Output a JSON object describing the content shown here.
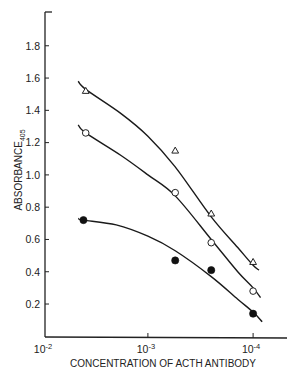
{
  "chart_data": {
    "type": "scatter",
    "title": "",
    "xlabel": "CONCENTRATION OF ACTH ANTIBODY",
    "ylabel": "ABSORBANCE",
    "ylabel_subscript": "405",
    "x_scale": "log",
    "x_reversed": true,
    "xlim": [
      0.01,
      6e-05
    ],
    "ylim": [
      0,
      1.95
    ],
    "x_ticks": [
      {
        "value": 0.01,
        "label": "10",
        "exp": "-2"
      },
      {
        "value": 0.001,
        "label": "10",
        "exp": "-3"
      },
      {
        "value": 0.0001,
        "label": "10",
        "exp": "-4"
      }
    ],
    "y_ticks": [
      0.2,
      0.4,
      0.6,
      0.8,
      1.0,
      1.2,
      1.4,
      1.6,
      1.8
    ],
    "y_tick_labels": [
      "0.2",
      "0.4",
      "0.6",
      "0.8",
      "1.0",
      "1.2",
      "1.4",
      "1.6",
      "1.8"
    ],
    "grid": false,
    "legend": null,
    "series": [
      {
        "name": "open triangles",
        "marker": "triangle-open",
        "x": [
          0.0039,
          0.00055,
          0.00025,
          0.0001
        ],
        "y": [
          1.52,
          1.15,
          0.76,
          0.46
        ],
        "fit_curve": [
          [
            0.0046,
            1.58
          ],
          [
            0.0039,
            1.53
          ],
          [
            0.0018,
            1.38
          ],
          [
            0.001,
            1.24
          ],
          [
            0.00055,
            1.05
          ],
          [
            0.00025,
            0.74
          ],
          [
            0.00014,
            0.55
          ],
          [
            0.0001,
            0.44
          ],
          [
            8.8e-05,
            0.41
          ]
        ]
      },
      {
        "name": "open circles",
        "marker": "circle-open",
        "x": [
          0.0039,
          0.00055,
          0.00025,
          0.0001
        ],
        "y": [
          1.26,
          0.89,
          0.58,
          0.28
        ],
        "fit_curve": [
          [
            0.0046,
            1.31
          ],
          [
            0.0039,
            1.26
          ],
          [
            0.0018,
            1.12
          ],
          [
            0.001,
            1.0
          ],
          [
            0.00055,
            0.87
          ],
          [
            0.00025,
            0.6
          ],
          [
            0.00014,
            0.4
          ],
          [
            0.0001,
            0.3
          ],
          [
            8.5e-05,
            0.24
          ]
        ]
      },
      {
        "name": "filled circles",
        "marker": "circle-filled",
        "x": [
          0.0041,
          0.00055,
          0.00025,
          0.0001
        ],
        "y": [
          0.72,
          0.47,
          0.41,
          0.14
        ],
        "fit_curve": [
          [
            0.0046,
            0.73
          ],
          [
            0.0041,
            0.72
          ],
          [
            0.002,
            0.69
          ],
          [
            0.001,
            0.62
          ],
          [
            0.00055,
            0.53
          ],
          [
            0.00025,
            0.37
          ],
          [
            0.00014,
            0.23
          ],
          [
            0.0001,
            0.15
          ],
          [
            8.2e-05,
            0.09
          ]
        ]
      }
    ]
  }
}
